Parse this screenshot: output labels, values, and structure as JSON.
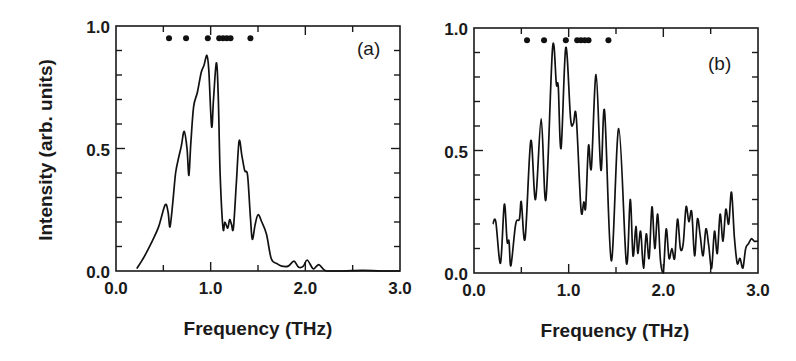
{
  "chart_data": [
    {
      "type": "line",
      "panel_label": "(a)",
      "title": "",
      "xlabel": "Frequency (THz)",
      "ylabel": "Intensity (arb. units)",
      "xlim": [
        0.0,
        3.0
      ],
      "ylim": [
        0.0,
        1.0
      ],
      "x_ticks": [
        "0.0",
        "1.0",
        "2.0",
        "3.0"
      ],
      "y_ticks": [
        "0.0",
        "0.5",
        "1.0"
      ],
      "grid": false,
      "markers": {
        "y": 0.95,
        "x": [
          0.56,
          0.74,
          0.97,
          1.09,
          1.13,
          1.17,
          1.21,
          1.42
        ]
      },
      "series": [
        {
          "name": "spectrum (a)",
          "x": [
            0.22,
            0.3,
            0.38,
            0.45,
            0.52,
            0.55,
            0.57,
            0.6,
            0.63,
            0.66,
            0.69,
            0.72,
            0.75,
            0.77,
            0.79,
            0.82,
            0.86,
            0.9,
            0.93,
            0.96,
            0.98,
            1.01,
            1.03,
            1.06,
            1.08,
            1.1,
            1.13,
            1.15,
            1.18,
            1.2,
            1.22,
            1.24,
            1.27,
            1.3,
            1.33,
            1.36,
            1.39,
            1.42,
            1.44,
            1.47,
            1.5,
            1.54,
            1.59,
            1.64,
            1.7,
            1.75,
            1.82,
            1.88,
            1.93,
            1.98,
            2.02,
            2.08,
            2.12,
            2.15,
            2.22,
            2.4,
            2.6,
            2.8,
            3.0
          ],
          "values": [
            0.01,
            0.06,
            0.12,
            0.18,
            0.27,
            0.24,
            0.18,
            0.28,
            0.4,
            0.46,
            0.51,
            0.57,
            0.5,
            0.39,
            0.52,
            0.67,
            0.73,
            0.81,
            0.84,
            0.88,
            0.82,
            0.59,
            0.7,
            0.85,
            0.72,
            0.4,
            0.175,
            0.2,
            0.175,
            0.21,
            0.19,
            0.175,
            0.35,
            0.53,
            0.47,
            0.41,
            0.39,
            0.22,
            0.13,
            0.19,
            0.23,
            0.2,
            0.15,
            0.05,
            0.03,
            0.02,
            0.02,
            0.04,
            0.015,
            0.02,
            0.045,
            0.01,
            0.02,
            0.025,
            0.0,
            0.0,
            0.003,
            0.0,
            0.0
          ]
        }
      ]
    },
    {
      "type": "line",
      "panel_label": "(b)",
      "title": "",
      "xlabel": "Frequency (THz)",
      "ylabel": "",
      "xlim": [
        0.0,
        3.0
      ],
      "ylim": [
        0.0,
        1.0
      ],
      "x_ticks": [
        "0.0",
        "1.0",
        "2.0",
        "3.0"
      ],
      "y_ticks": [
        "0.0",
        "0.5",
        "1.0"
      ],
      "grid": false,
      "markers": {
        "y": 0.95,
        "x": [
          0.56,
          0.74,
          0.97,
          1.09,
          1.13,
          1.17,
          1.21,
          1.42
        ]
      },
      "series": [
        {
          "name": "spectrum (b)",
          "x": [
            0.2,
            0.23,
            0.28,
            0.32,
            0.35,
            0.37,
            0.39,
            0.44,
            0.48,
            0.5,
            0.54,
            0.6,
            0.65,
            0.71,
            0.76,
            0.83,
            0.87,
            0.89,
            0.92,
            0.97,
            1.02,
            1.05,
            1.08,
            1.13,
            1.16,
            1.18,
            1.21,
            1.24,
            1.29,
            1.34,
            1.38,
            1.45,
            1.53,
            1.61,
            1.65,
            1.68,
            1.71,
            1.73,
            1.76,
            1.79,
            1.82,
            1.85,
            1.88,
            1.91,
            1.94,
            1.97,
            2.0,
            2.03,
            2.06,
            2.09,
            2.12,
            2.15,
            2.18,
            2.21,
            2.24,
            2.27,
            2.3,
            2.33,
            2.36,
            2.39,
            2.42,
            2.45,
            2.48,
            2.51,
            2.54,
            2.57,
            2.6,
            2.63,
            2.66,
            2.69,
            2.72,
            2.75,
            2.78,
            2.81,
            2.84,
            2.87,
            2.9,
            2.93,
            2.96,
            3.0
          ],
          "values": [
            0.2,
            0.21,
            0.04,
            0.28,
            0.13,
            0.13,
            0.03,
            0.2,
            0.22,
            0.29,
            0.14,
            0.54,
            0.3,
            0.63,
            0.3,
            0.92,
            0.77,
            0.76,
            0.51,
            0.92,
            0.63,
            0.61,
            0.64,
            0.26,
            0.29,
            0.27,
            0.52,
            0.43,
            0.81,
            0.42,
            0.66,
            0.05,
            0.59,
            0.04,
            0.3,
            0.07,
            0.19,
            0.08,
            0.17,
            0.02,
            0.16,
            0.06,
            0.27,
            0.1,
            0.24,
            0.05,
            0.0,
            0.18,
            0.06,
            0.1,
            0.06,
            0.22,
            0.1,
            0.12,
            0.27,
            0.21,
            0.25,
            0.07,
            0.22,
            0.15,
            0.07,
            0.18,
            0.11,
            0.02,
            0.17,
            0.08,
            0.24,
            0.13,
            0.26,
            0.2,
            0.33,
            0.15,
            0.04,
            0.06,
            0.02,
            0.1,
            0.12,
            0.14,
            0.13,
            0.13
          ]
        }
      ]
    }
  ],
  "panels": [
    {
      "label": "(a)",
      "xlabel": "Frequency (THz)",
      "ylabel": "Intensity (arb. units)"
    },
    {
      "label": "(b)",
      "xlabel": "Frequency (THz)"
    }
  ]
}
